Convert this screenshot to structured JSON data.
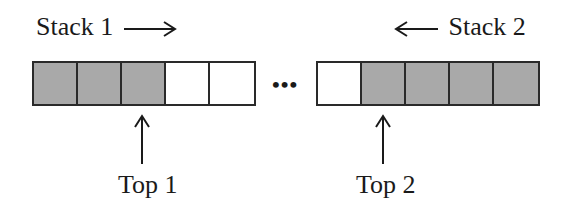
{
  "diagram": {
    "stack1": {
      "label": "Stack 1",
      "direction": "right",
      "arrow_glyph": "→",
      "cells": [
        "filled",
        "filled",
        "filled",
        "empty",
        "empty"
      ]
    },
    "ellipsis": "•••",
    "stack2": {
      "label": "Stack 2",
      "direction": "left",
      "arrow_glyph": "←",
      "cells": [
        "empty",
        "filled",
        "filled",
        "filled",
        "filled"
      ]
    },
    "top1": {
      "label": "Top 1",
      "points_to_cell": 3
    },
    "top2": {
      "label": "Top 2",
      "points_to_cell": 2
    },
    "colors": {
      "filled": "#a9a9a9",
      "empty": "#ffffff",
      "stroke": "#2a2a2a"
    }
  }
}
